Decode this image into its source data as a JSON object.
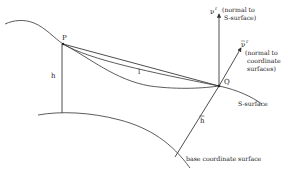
{
  "diagram": {
    "points": {
      "P": "P",
      "Q": "Q"
    },
    "segments": {
      "h": "h",
      "h_bar": "h",
      "l": "l"
    },
    "vectors": {
      "nu_r": {
        "symbol": "ν",
        "superscript": "r",
        "note_line1": "(normal to",
        "note_line2": "S-surface)"
      },
      "nu_bar_r": {
        "symbol": "ν",
        "superscript": "r",
        "note_line1": "(normal to",
        "note_line2": "coordinate",
        "note_line3": "surfaces)"
      }
    },
    "surfaces": {
      "s_surface": "S-surface",
      "base": "base coordinate surface"
    }
  }
}
